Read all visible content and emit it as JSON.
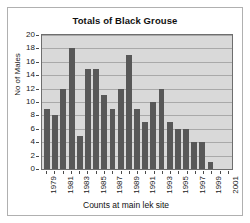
{
  "chart_data": {
    "type": "bar",
    "title": "Totals of Black Grouse",
    "xlabel": "Counts at main lek site",
    "ylabel": "No of Males",
    "ylim": [
      0,
      20
    ],
    "ytick_step": 2,
    "yticks": [
      0,
      2,
      4,
      6,
      8,
      10,
      12,
      14,
      16,
      18,
      20
    ],
    "grid": true,
    "legend": false,
    "bar_color": "#585858",
    "plot_background": "#d9d9d9",
    "categories": [
      "1979",
      "1980",
      "1981",
      "1982",
      "1983",
      "1984",
      "1985",
      "1986",
      "1987",
      "1988",
      "1989",
      "1990",
      "1991",
      "1992",
      "1993",
      "1994",
      "1995",
      "1996",
      "1997",
      "1998",
      "1999",
      "2000",
      "2001"
    ],
    "visible_tick_labels": [
      "1979",
      "",
      "1981",
      "",
      "1983",
      "",
      "1985",
      "",
      "1987",
      "",
      "1989",
      "",
      "1991",
      "",
      "1993",
      "",
      "1995",
      "",
      "1997",
      "",
      "1999",
      "",
      "2001"
    ],
    "values": [
      9,
      8,
      12,
      18,
      5,
      15,
      15,
      11,
      9,
      12,
      17,
      9,
      7,
      10,
      12,
      7,
      6,
      6,
      4,
      4,
      1,
      0,
      0
    ]
  }
}
